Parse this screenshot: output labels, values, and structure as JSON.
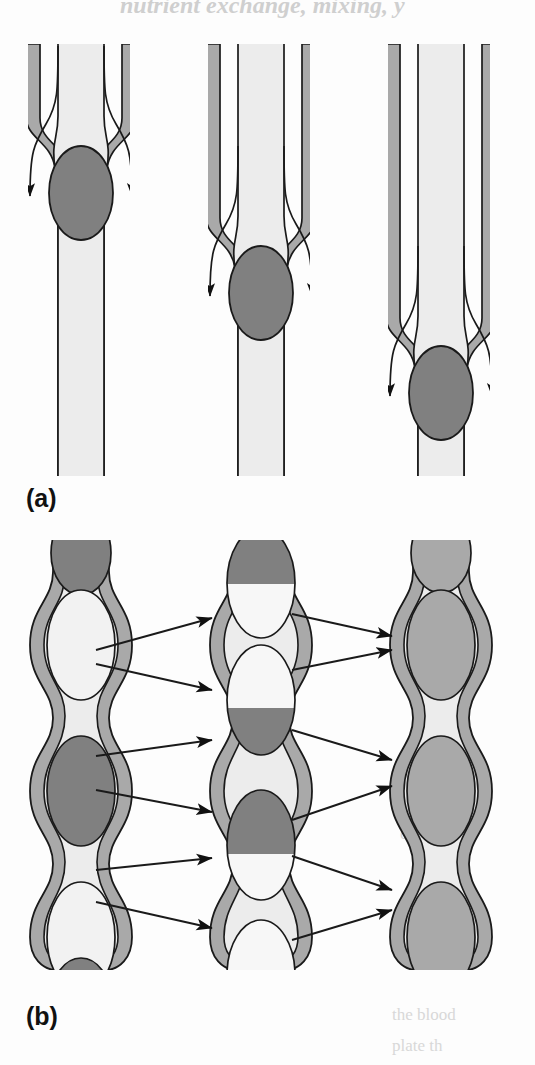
{
  "figure": {
    "title_fragment": "nutrient exchange, mixing, y",
    "panels": [
      {
        "id": "a",
        "label": "(a)",
        "description": "Three capillary tube segments, each with a constriction and a dark bolus, shown at successively lower axial positions with streamlines diverging around the bolus",
        "tubes": [
          {
            "name": "tube-1",
            "bolus_center_y": 185,
            "constriction_y": 137,
            "bolus_fill": "#808080"
          },
          {
            "name": "tube-2",
            "bolus_center_y": 285,
            "constriction_y": 237,
            "bolus_fill": "#808080"
          },
          {
            "name": "tube-3",
            "bolus_center_y": 385,
            "constriction_y": 337,
            "bolus_fill": "#808080"
          }
        ]
      },
      {
        "id": "b",
        "label": "(b)",
        "description": "Three beaded peristaltic vessel chains showing progressive mixing of dark and light boluses",
        "columns": [
          {
            "name": "column-unmixed",
            "state": "unmixed",
            "beads": [
              "dark",
              "light",
              "dark",
              "light",
              "dark"
            ]
          },
          {
            "name": "column-partially-mixed",
            "state": "partially-mixed",
            "beads": [
              "split-dark-top",
              "split-dark-bottom",
              "split-dark-top",
              "split-dark-bottom",
              "split-dark-bottom"
            ]
          },
          {
            "name": "column-fully-mixed",
            "state": "fully-mixed",
            "beads": [
              "uniform",
              "uniform",
              "uniform",
              "uniform",
              "uniform"
            ]
          }
        ],
        "arrow_pairs_per_gap": 3,
        "arrows_per_gap": 6
      }
    ],
    "colors": {
      "wall_fill": "#a9a9a9",
      "lumen_fill": "#ececec",
      "bolus_dark": "#808080",
      "bolus_light": "#f2f2f2",
      "bolus_mixed": "#a9a9a9",
      "outline": "#1a1a1a",
      "background": "#fdfdfd",
      "arrow": "#111111"
    }
  },
  "bleed_through": {
    "top": "nutrient exchange, mixing, y",
    "right_1": "ortio",
    "right_2": "the blood",
    "right_3": "plate th"
  }
}
